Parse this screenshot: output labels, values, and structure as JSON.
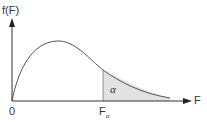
{
  "diagram": {
    "y_axis_label": "f(F)",
    "x_axis_label": "F",
    "origin_label": "0",
    "critical_value_label": "F",
    "critical_value_subscript": "α",
    "area_label": "α",
    "colors": {
      "axis": "#333333",
      "curve": "#555555",
      "shade": "#e2e2e2"
    }
  }
}
